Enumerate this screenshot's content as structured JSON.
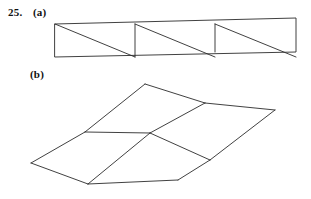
{
  "problem": {
    "number": "25.",
    "part_a_label": "(a)",
    "part_b_label": "(b)"
  },
  "ink_color": "#2b2b2b",
  "background_color": "#ffffff",
  "figure_a": {
    "name": "triangulated-parallelogram-strip",
    "description": "Long thin parallelogram divided into triangles by alternating diagonals",
    "outline_points": "55,24 296,18 296,52 55,57",
    "diagonals": [
      "55,24 135,57",
      "135,24 215,57",
      "215,24 296,57"
    ],
    "crossbars": [
      "135,24 135,57",
      "215,24 215,52"
    ]
  },
  "figure_b": {
    "name": "folded-quadrilateral-net",
    "description": "Perspective arrangement of four quadrilaterals meeting at a central vertex",
    "vertices": {
      "top_apex": "145,84",
      "upper_right": "205,103",
      "far_right": "275,110",
      "center": "150,133",
      "left_mid": "85,132",
      "left_far": "31,163",
      "bottom_left": "88,184",
      "bottom_mid": "178,180",
      "lower_right": "210,160"
    },
    "edges": [
      "145,84 85,132",
      "145,84 205,103",
      "205,103 150,133",
      "85,132 150,133",
      "85,132 31,163",
      "31,163 88,184",
      "88,184 150,133",
      "205,103 275,110",
      "275,110 210,160",
      "210,160 150,133",
      "210,160 178,180",
      "178,180 88,184"
    ]
  }
}
